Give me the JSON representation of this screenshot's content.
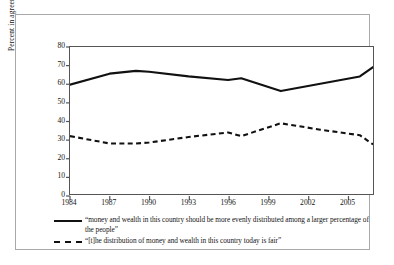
{
  "chart_data": {
    "type": "line",
    "title": "",
    "xlabel": "",
    "ylabel": "Percent in agreement",
    "ylim": [
      0,
      80
    ],
    "xlim": [
      1984,
      2007
    ],
    "grid": false,
    "legend_position": "below-plot",
    "yticks": [
      80,
      70,
      60,
      50,
      40,
      30,
      20,
      10,
      0
    ],
    "xticks": [
      1984,
      1987,
      1990,
      1993,
      1996,
      1999,
      2002,
      2005
    ],
    "x": [
      1984,
      1987,
      1989,
      1990,
      1993,
      1996,
      1997,
      2000,
      2003,
      2006,
      2007
    ],
    "series": [
      {
        "name": "“money and wealth in this country should be more evenly distributed among a larger percentage of the people”",
        "style": "solid",
        "color": "#111111",
        "values": [
          59.5,
          65.5,
          67,
          66.5,
          64,
          62,
          63,
          56,
          60,
          64,
          69
        ]
      },
      {
        "name": "“[t]he distribution of money and wealth in this country today is fair”",
        "style": "dashed",
        "color": "#111111",
        "values": [
          31.5,
          27.5,
          27.5,
          28,
          31,
          33.5,
          31.5,
          38.5,
          35,
          32,
          27
        ]
      }
    ]
  },
  "axis": {
    "ylabel": "Percent in agreement",
    "ytick_labels": [
      "80",
      "70",
      "60",
      "50",
      "40",
      "30",
      "20",
      "10",
      "0"
    ],
    "xtick_labels": [
      "1984",
      "1987",
      "1990",
      "1993",
      "1996",
      "1999",
      "2002",
      "2005"
    ]
  },
  "legend": {
    "entries": [
      {
        "style": "solid",
        "label": "“money and wealth in this country should be more evenly distributed among a larger percentage of the people”"
      },
      {
        "style": "dashed",
        "label": "“[t]he distribution of money and wealth in this country today is fair”"
      }
    ]
  }
}
